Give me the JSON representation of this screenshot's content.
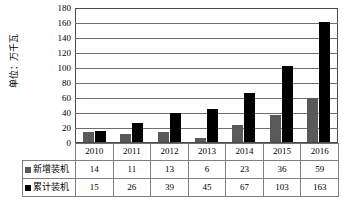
{
  "chart_data": {
    "type": "bar",
    "title": "",
    "subtitle": "",
    "xlabel": "",
    "ylabel": "单位：万千瓦",
    "categories": [
      "2010",
      "2011",
      "2012",
      "2013",
      "2014",
      "2015",
      "2016"
    ],
    "series": [
      {
        "name": "新增装机",
        "color": "#595959",
        "values": [
          14,
          11,
          13,
          6,
          23,
          36,
          59
        ]
      },
      {
        "name": "累计装机",
        "color": "#000000",
        "values": [
          15,
          26,
          39,
          45,
          67,
          103,
          163
        ]
      }
    ],
    "ylim": [
      0,
      180
    ],
    "ytick_step": 20,
    "yticks": [
      "180",
      "160",
      "140",
      "120",
      "100",
      "80",
      "60",
      "40",
      "20",
      "0"
    ],
    "grid": true,
    "legend_position": "table-left",
    "table": {
      "row_labels": [
        "新增装机",
        "累计装机"
      ],
      "columns": [
        "2010",
        "2011",
        "2012",
        "2013",
        "2014",
        "2015",
        "2016"
      ],
      "rows": [
        [
          "14",
          "11",
          "13",
          "6",
          "23",
          "36",
          "59"
        ],
        [
          "15",
          "26",
          "39",
          "45",
          "67",
          "103",
          "163"
        ]
      ]
    },
    "colors": {
      "series_new": "#595959",
      "series_cumulative": "#000000",
      "gridline": "#6e6e6e",
      "frame": "#4a4a4a",
      "table_border": "#808080",
      "background": "#ffffff"
    }
  }
}
